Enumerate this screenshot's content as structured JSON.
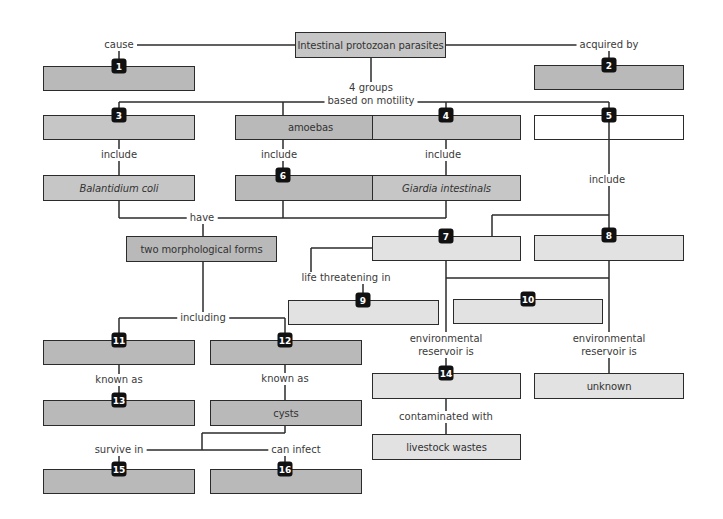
{
  "diagram": {
    "title": "Intestinal protozoan parasites",
    "colors": {
      "line": "#2b2b2b",
      "box_dark": "#b9b9b9",
      "box_mid": "#c6c6c6",
      "box_light": "#e2e2e2",
      "badge": "#111111"
    },
    "links": {
      "cause": "cause",
      "acquired_by": "acquired by",
      "groups_line1": "4 groups",
      "groups_line2": "based on motility",
      "include_3": "include",
      "include_amoebas": "include",
      "include_4": "include",
      "include_5": "include",
      "have": "have",
      "life_threatening": "life threatening in",
      "including": "including",
      "env_res_7_line1": "environmental",
      "env_res_7_line2": "reservoir is",
      "env_res_8_line1": "environmental",
      "env_res_8_line2": "reservoir is",
      "known_as_11": "known as",
      "known_as_12": "known as",
      "contaminated_with": "contaminated with",
      "survive_in": "survive in",
      "can_infect": "can infect"
    },
    "nodes": {
      "amoebas": "amoebas",
      "balantidium": "Balantidium coli",
      "giardia": "Giardia intestinals",
      "forms": "two morphological forms",
      "unknown": "unknown",
      "cysts": "cysts",
      "livestock": "livestock wastes",
      "blank": ""
    },
    "badges": [
      "1",
      "2",
      "3",
      "4",
      "5",
      "6",
      "7",
      "8",
      "9",
      "10",
      "11",
      "12",
      "13",
      "14",
      "15",
      "16"
    ]
  }
}
